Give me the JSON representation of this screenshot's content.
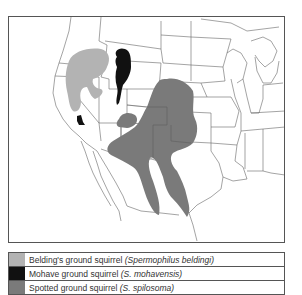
{
  "map": {
    "title": "Ranges of ground squirrels in western North America",
    "colors": {
      "belding": "#b3b3b3",
      "mohave": "#111111",
      "spotted": "#7a7a7a",
      "borders": "#666666"
    }
  },
  "legend": {
    "items": [
      {
        "id": "belding",
        "common": "Belding's ground squirrel",
        "scientific": "(Spermophilus beldingi)",
        "color": "#b3b3b3"
      },
      {
        "id": "mohave",
        "common": "Mohave ground squirrel",
        "scientific": "(S. mohavensis)",
        "color": "#111111"
      },
      {
        "id": "spotted",
        "common": "Spotted ground squirrel",
        "scientific": "(S. spilosoma)",
        "color": "#7a7a7a"
      }
    ]
  }
}
